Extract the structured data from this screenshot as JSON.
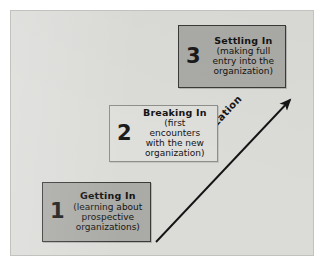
{
  "figure": {
    "canvas_color": "#dbdbd8",
    "frame_color": "#c2c2bf"
  },
  "arrow": {
    "label": "Socialization",
    "color": "#141414",
    "direction": "bottom-left to top-right",
    "start": {
      "x": 145,
      "y": 231
    },
    "end": {
      "x": 281,
      "y": 87
    }
  },
  "stages": [
    {
      "number": "1",
      "title": "Getting In",
      "desc_lines": [
        "(learning about",
        "prospective",
        "organizations)"
      ],
      "fill": "#aaaaa6",
      "border": "#3a3a38",
      "style": "dark"
    },
    {
      "number": "2",
      "title": "Breaking In",
      "desc_lines": [
        "(first encounters",
        "with the new",
        "organization)"
      ],
      "fill": "#dededb",
      "border": "#8e8e8b",
      "style": "light"
    },
    {
      "number": "3",
      "title": "Settling In",
      "desc_lines": [
        "(making full",
        "entry into the",
        "organization)"
      ],
      "fill": "#aaaaa6",
      "border": "#3a3a38",
      "style": "dark"
    }
  ]
}
